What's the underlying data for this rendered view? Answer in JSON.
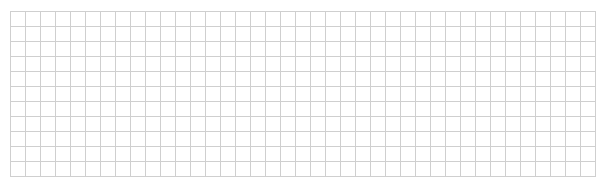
{
  "grid": {
    "columns": 39,
    "rows": 11,
    "cell_size_px": 15,
    "line_color": "#cfcfcf",
    "background_color": "#ffffff"
  }
}
